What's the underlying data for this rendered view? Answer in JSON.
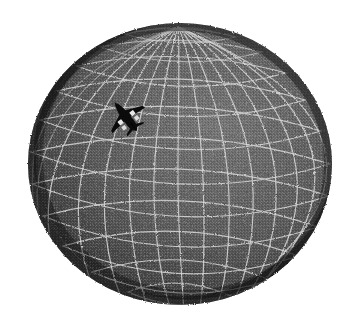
{
  "scene": {
    "title": "3D wireframe globe with aircraft",
    "background_color": "#ffffff",
    "width": 357,
    "height": 319
  },
  "globe": {
    "name": "globe",
    "center_x": 180,
    "center_y": 164,
    "radius_x": 152,
    "radius_y": 141,
    "surface_color": "#5a5a5a",
    "surface_light_color": "#6f6f6f",
    "surface_dark_color": "#262626",
    "grid_color": "#d9d9d9",
    "grid_line_width": 1.2,
    "texture": "dithered-halftone",
    "latitude_count": 12,
    "longitude_count": 16,
    "tilt_degrees": -8,
    "pole_x": 178,
    "pole_y": 27,
    "light_direction": "upper-right"
  },
  "aircraft": {
    "name": "aircraft-silhouette",
    "color": "#0b0b0b",
    "highlight_color": "#e8e8e8",
    "x": 103,
    "y": 98,
    "width": 46,
    "height": 38,
    "heading_degrees": 38,
    "type": "swept-wing-jet"
  }
}
